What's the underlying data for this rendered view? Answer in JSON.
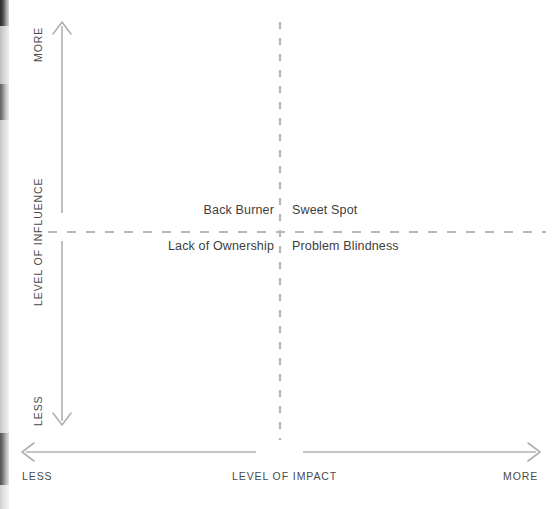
{
  "diagram": {
    "type": "2x2-matrix",
    "colors": {
      "axis_line": "#b0b0b0",
      "divider_line": "#b8b8b8",
      "axis_text": "#4a4a4a",
      "quadrant_text": "#3d3d3d",
      "background": "#ffffff"
    },
    "y_axis": {
      "title": "LEVEL OF INFLUENCE",
      "high_label": "MORE",
      "low_label": "LESS"
    },
    "x_axis": {
      "title": "LEVEL OF IMPACT",
      "low_label": "LESS",
      "high_label": "MORE"
    },
    "quadrants": {
      "top_left": "Back Burner",
      "top_right": "Sweet Spot",
      "bottom_left": "Lack of Ownership",
      "bottom_right": "Problem Blindness"
    }
  }
}
